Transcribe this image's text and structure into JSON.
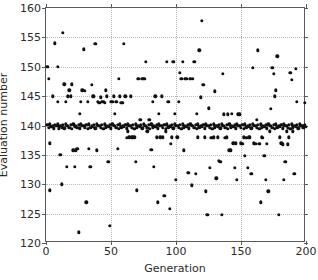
{
  "chart_data": {
    "type": "scatter",
    "title": "",
    "xlabel": "Generation",
    "ylabel": "Evaluation number",
    "xlim": [
      0,
      200
    ],
    "ylim": [
      120,
      160
    ],
    "xticks": [
      0,
      50,
      100,
      150,
      200
    ],
    "yticks": [
      120,
      125,
      130,
      135,
      140,
      145,
      150,
      155,
      160
    ],
    "grid": true,
    "grid_style": "dotted",
    "legend": null,
    "marker": "circle",
    "marker_color": "#111111",
    "note": "Dense saturated band of markers at y=139-140 spanning the full generation range; scattered outliers above and below.",
    "points": [
      [
        1,
        150.0
      ],
      [
        2,
        148.0
      ],
      [
        3,
        137.0
      ],
      [
        3,
        129.0
      ],
      [
        5,
        145.0
      ],
      [
        7,
        154.0
      ],
      [
        9,
        150.0
      ],
      [
        9,
        144.0
      ],
      [
        10,
        139.8
      ],
      [
        11,
        135.0
      ],
      [
        12,
        130.0
      ],
      [
        13,
        155.8
      ],
      [
        14,
        147.0
      ],
      [
        15,
        144.0
      ],
      [
        16,
        133.0
      ],
      [
        17,
        145.0
      ],
      [
        18,
        146.0
      ],
      [
        19,
        145.0
      ],
      [
        20,
        147.0
      ],
      [
        21,
        135.8
      ],
      [
        22,
        133.0
      ],
      [
        23,
        135.8
      ],
      [
        24,
        136.0
      ],
      [
        25,
        121.8
      ],
      [
        26,
        142.0
      ],
      [
        27,
        144.0
      ],
      [
        28,
        146.0
      ],
      [
        29,
        153.0
      ],
      [
        30,
        145.9
      ],
      [
        31,
        126.9
      ],
      [
        32,
        144.0
      ],
      [
        33,
        136.0
      ],
      [
        34,
        133.0
      ],
      [
        35,
        146.9
      ],
      [
        36,
        145.0
      ],
      [
        37,
        145.0
      ],
      [
        38,
        153.9
      ],
      [
        39,
        135.8
      ],
      [
        40,
        144.0
      ],
      [
        41,
        143.9
      ],
      [
        42,
        144.8
      ],
      [
        43,
        144.0
      ],
      [
        44,
        144.0
      ],
      [
        45,
        143.9
      ],
      [
        46,
        146.0
      ],
      [
        47,
        145.0
      ],
      [
        48,
        133.8
      ],
      [
        49,
        122.9
      ],
      [
        50,
        144.0
      ],
      [
        51,
        144.0
      ],
      [
        52,
        145.0
      ],
      [
        53,
        142.0
      ],
      [
        54,
        144.0
      ],
      [
        55,
        136.0
      ],
      [
        56,
        147.9
      ],
      [
        57,
        145.0
      ],
      [
        58,
        143.9
      ],
      [
        59,
        143.9
      ],
      [
        60,
        153.9
      ],
      [
        61,
        145.0
      ],
      [
        62,
        137.9
      ],
      [
        63,
        139.0
      ],
      [
        64,
        138.0
      ],
      [
        65,
        145.0
      ],
      [
        66,
        138.0
      ],
      [
        67,
        138.0
      ],
      [
        68,
        138.0
      ],
      [
        69,
        133.8
      ],
      [
        70,
        129.0
      ],
      [
        71,
        147.9
      ],
      [
        72,
        141.0
      ],
      [
        73,
        141.0
      ],
      [
        74,
        147.9
      ],
      [
        75,
        147.9
      ],
      [
        76,
        147.9
      ],
      [
        77,
        150.8
      ],
      [
        78,
        139.0
      ],
      [
        79,
        141.0
      ],
      [
        80,
        141.0
      ],
      [
        81,
        135.9
      ],
      [
        82,
        144.0
      ],
      [
        83,
        133.0
      ],
      [
        84,
        145.0
      ],
      [
        85,
        138.0
      ],
      [
        86,
        126.9
      ],
      [
        87,
        142.0
      ],
      [
        88,
        138.0
      ],
      [
        89,
        145.0
      ],
      [
        90,
        138.0
      ],
      [
        91,
        128.0
      ],
      [
        92,
        139.0
      ],
      [
        93,
        150.8
      ],
      [
        94,
        144.0
      ],
      [
        95,
        125.8
      ],
      [
        96,
        136.9
      ],
      [
        97,
        138.0
      ],
      [
        98,
        150.8
      ],
      [
        99,
        142.0
      ],
      [
        100,
        130.8
      ],
      [
        101,
        138.0
      ],
      [
        102,
        144.0
      ],
      [
        103,
        149.0
      ],
      [
        104,
        148.0
      ],
      [
        105,
        150.8
      ],
      [
        106,
        135.8
      ],
      [
        107,
        147.9
      ],
      [
        108,
        147.9
      ],
      [
        109,
        132.0
      ],
      [
        110,
        132.0
      ],
      [
        111,
        148.0
      ],
      [
        112,
        129.8
      ],
      [
        113,
        147.9
      ],
      [
        114,
        150.8
      ],
      [
        115,
        131.8
      ],
      [
        116,
        142.0
      ],
      [
        117,
        138.0
      ],
      [
        118,
        152.8
      ],
      [
        119,
        144.8
      ],
      [
        120,
        157.8
      ],
      [
        121,
        146.9
      ],
      [
        122,
        138.0
      ],
      [
        123,
        128.8
      ],
      [
        124,
        124.8
      ],
      [
        125,
        142.9
      ],
      [
        126,
        132.8
      ],
      [
        127,
        137.9
      ],
      [
        128,
        137.9
      ],
      [
        129,
        138.0
      ],
      [
        130,
        145.8
      ],
      [
        131,
        131.0
      ],
      [
        132,
        138.0
      ],
      [
        133,
        134.0
      ],
      [
        134,
        133.8
      ],
      [
        135,
        124.8
      ],
      [
        136,
        148.8
      ],
      [
        137,
        141.9
      ],
      [
        138,
        137.9
      ],
      [
        139,
        138.0
      ],
      [
        140,
        141.9
      ],
      [
        141,
        135.8
      ],
      [
        142,
        135.8
      ],
      [
        143,
        142.0
      ],
      [
        144,
        137.0
      ],
      [
        145,
        132.8
      ],
      [
        146,
        137.0
      ],
      [
        147,
        130.8
      ],
      [
        148,
        141.9
      ],
      [
        149,
        141.9
      ],
      [
        150,
        137.0
      ],
      [
        151,
        136.9
      ],
      [
        152,
        138.0
      ],
      [
        153,
        134.8
      ],
      [
        154,
        137.9
      ],
      [
        155,
        132.8
      ],
      [
        156,
        138.0
      ],
      [
        157,
        138.0
      ],
      [
        158,
        131.8
      ],
      [
        159,
        149.8
      ],
      [
        160,
        137.0
      ],
      [
        161,
        136.9
      ],
      [
        162,
        141.0
      ],
      [
        163,
        152.8
      ],
      [
        164,
        136.9
      ],
      [
        165,
        126.9
      ],
      [
        166,
        138.0
      ],
      [
        167,
        137.9
      ],
      [
        168,
        134.8
      ],
      [
        169,
        130.8
      ],
      [
        170,
        136.9
      ],
      [
        171,
        128.8
      ],
      [
        172,
        139.0
      ],
      [
        173,
        142.8
      ],
      [
        174,
        149.8
      ],
      [
        175,
        148.8
      ],
      [
        176,
        145.0
      ],
      [
        177,
        146.0
      ],
      [
        178,
        151.8
      ],
      [
        179,
        124.8
      ],
      [
        180,
        138.0
      ],
      [
        181,
        137.0
      ],
      [
        182,
        136.8
      ],
      [
        183,
        130.8
      ],
      [
        184,
        133.8
      ],
      [
        185,
        139.0
      ],
      [
        186,
        136.8
      ],
      [
        187,
        138.0
      ],
      [
        188,
        149.0
      ],
      [
        189,
        147.8
      ],
      [
        190,
        139.0
      ],
      [
        191,
        131.8
      ],
      [
        192,
        149.7
      ],
      [
        193,
        144.0
      ],
      [
        196,
        140.0
      ],
      [
        198,
        140.0
      ],
      [
        199,
        143.9
      ],
      [
        2,
        139.6
      ],
      [
        4,
        139.8
      ],
      [
        6,
        139.5
      ],
      [
        8,
        139.9
      ],
      [
        10,
        139.4
      ],
      [
        12,
        139.7
      ],
      [
        14,
        139.5
      ],
      [
        16,
        139.9
      ],
      [
        18,
        139.6
      ],
      [
        20,
        139.4
      ],
      [
        22,
        139.8
      ],
      [
        24,
        139.6
      ],
      [
        26,
        139.5
      ],
      [
        28,
        139.9
      ],
      [
        30,
        139.7
      ],
      [
        32,
        139.4
      ],
      [
        34,
        139.6
      ],
      [
        36,
        139.8
      ],
      [
        38,
        139.5
      ],
      [
        40,
        139.9
      ],
      [
        42,
        139.6
      ],
      [
        44,
        139.4
      ],
      [
        46,
        139.7
      ],
      [
        48,
        139.8
      ],
      [
        50,
        139.5
      ],
      [
        52,
        139.9
      ],
      [
        54,
        139.6
      ],
      [
        56,
        139.4
      ],
      [
        58,
        139.7
      ],
      [
        60,
        139.8
      ],
      [
        62,
        139.5
      ],
      [
        64,
        139.9
      ],
      [
        66,
        139.6
      ],
      [
        68,
        139.4
      ],
      [
        70,
        139.7
      ],
      [
        72,
        139.8
      ],
      [
        74,
        139.5
      ],
      [
        76,
        139.9
      ],
      [
        78,
        139.6
      ],
      [
        80,
        139.4
      ],
      [
        82,
        139.7
      ],
      [
        84,
        139.8
      ],
      [
        86,
        139.5
      ],
      [
        88,
        139.9
      ],
      [
        90,
        139.6
      ],
      [
        92,
        139.4
      ],
      [
        94,
        139.7
      ],
      [
        96,
        139.8
      ],
      [
        98,
        139.5
      ],
      [
        100,
        139.9
      ],
      [
        102,
        139.6
      ],
      [
        104,
        139.4
      ],
      [
        106,
        139.7
      ],
      [
        108,
        139.8
      ],
      [
        110,
        139.5
      ],
      [
        112,
        139.9
      ],
      [
        114,
        139.6
      ],
      [
        116,
        139.4
      ],
      [
        118,
        139.7
      ],
      [
        120,
        139.8
      ],
      [
        122,
        139.5
      ],
      [
        124,
        139.9
      ],
      [
        126,
        139.6
      ],
      [
        128,
        139.4
      ],
      [
        130,
        139.7
      ],
      [
        132,
        139.8
      ],
      [
        134,
        139.5
      ],
      [
        136,
        139.9
      ],
      [
        138,
        139.6
      ],
      [
        140,
        139.4
      ],
      [
        142,
        139.7
      ],
      [
        144,
        139.8
      ],
      [
        146,
        139.5
      ],
      [
        148,
        139.9
      ],
      [
        150,
        139.6
      ],
      [
        152,
        139.4
      ],
      [
        154,
        139.7
      ],
      [
        156,
        139.8
      ],
      [
        158,
        139.5
      ],
      [
        160,
        139.9
      ],
      [
        162,
        139.6
      ],
      [
        164,
        139.4
      ],
      [
        166,
        139.7
      ],
      [
        168,
        139.8
      ],
      [
        170,
        139.5
      ],
      [
        172,
        139.9
      ],
      [
        174,
        139.6
      ],
      [
        176,
        139.4
      ],
      [
        178,
        139.7
      ],
      [
        180,
        139.8
      ],
      [
        182,
        139.5
      ],
      [
        184,
        139.9
      ],
      [
        186,
        139.6
      ],
      [
        188,
        139.4
      ],
      [
        190,
        139.7
      ],
      [
        192,
        139.8
      ],
      [
        194,
        139.5
      ],
      [
        196,
        139.9
      ],
      [
        198,
        139.6
      ],
      [
        200,
        139.8
      ],
      [
        1,
        140.1
      ],
      [
        3,
        140.2
      ],
      [
        5,
        139.9
      ],
      [
        7,
        140.1
      ],
      [
        9,
        140.2
      ],
      [
        11,
        139.9
      ],
      [
        13,
        140.1
      ],
      [
        15,
        140.2
      ],
      [
        17,
        139.9
      ],
      [
        19,
        140.1
      ],
      [
        21,
        140.2
      ],
      [
        23,
        139.9
      ],
      [
        25,
        140.1
      ],
      [
        27,
        140.2
      ],
      [
        29,
        139.9
      ],
      [
        31,
        140.1
      ],
      [
        33,
        140.2
      ],
      [
        35,
        139.9
      ],
      [
        37,
        140.1
      ],
      [
        39,
        140.2
      ],
      [
        41,
        139.9
      ],
      [
        43,
        140.1
      ],
      [
        45,
        140.2
      ],
      [
        47,
        139.9
      ],
      [
        49,
        140.1
      ],
      [
        51,
        140.2
      ],
      [
        53,
        139.9
      ],
      [
        55,
        140.1
      ],
      [
        57,
        140.2
      ],
      [
        59,
        139.9
      ],
      [
        61,
        140.1
      ],
      [
        63,
        140.2
      ],
      [
        65,
        139.9
      ],
      [
        67,
        140.1
      ],
      [
        69,
        140.2
      ],
      [
        71,
        139.9
      ],
      [
        73,
        140.1
      ],
      [
        75,
        140.2
      ],
      [
        77,
        139.9
      ],
      [
        79,
        140.1
      ],
      [
        81,
        140.2
      ],
      [
        83,
        139.9
      ],
      [
        85,
        140.1
      ],
      [
        87,
        140.2
      ],
      [
        89,
        139.9
      ],
      [
        91,
        140.1
      ],
      [
        93,
        140.2
      ],
      [
        95,
        139.9
      ],
      [
        97,
        140.1
      ],
      [
        99,
        140.2
      ],
      [
        101,
        139.9
      ],
      [
        103,
        140.1
      ],
      [
        105,
        140.2
      ],
      [
        107,
        139.9
      ],
      [
        109,
        140.1
      ],
      [
        111,
        140.2
      ],
      [
        113,
        139.9
      ],
      [
        115,
        140.1
      ],
      [
        117,
        140.2
      ],
      [
        119,
        139.9
      ],
      [
        121,
        140.1
      ],
      [
        123,
        140.2
      ],
      [
        125,
        139.9
      ],
      [
        127,
        140.1
      ],
      [
        129,
        140.2
      ],
      [
        131,
        139.9
      ],
      [
        133,
        140.1
      ],
      [
        135,
        140.2
      ],
      [
        137,
        139.9
      ],
      [
        139,
        140.1
      ],
      [
        141,
        140.2
      ],
      [
        143,
        139.9
      ],
      [
        145,
        140.1
      ],
      [
        147,
        140.2
      ],
      [
        149,
        139.9
      ],
      [
        151,
        140.1
      ],
      [
        153,
        140.2
      ],
      [
        155,
        139.9
      ],
      [
        157,
        140.1
      ],
      [
        159,
        140.2
      ],
      [
        161,
        139.9
      ],
      [
        163,
        140.1
      ],
      [
        165,
        140.2
      ],
      [
        167,
        139.9
      ],
      [
        169,
        140.1
      ],
      [
        171,
        140.2
      ],
      [
        173,
        139.9
      ],
      [
        175,
        140.1
      ],
      [
        177,
        140.2
      ],
      [
        179,
        139.9
      ],
      [
        181,
        140.1
      ],
      [
        183,
        140.2
      ],
      [
        185,
        139.9
      ],
      [
        187,
        140.1
      ],
      [
        189,
        140.2
      ],
      [
        191,
        139.9
      ],
      [
        193,
        140.1
      ],
      [
        195,
        140.2
      ],
      [
        197,
        139.9
      ],
      [
        199,
        140.1
      ]
    ]
  }
}
